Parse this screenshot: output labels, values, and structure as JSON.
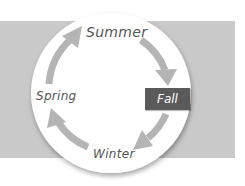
{
  "diagram": {
    "highlighted": "Fall",
    "stages": [
      {
        "id": "summer",
        "label": "Summer"
      },
      {
        "id": "fall",
        "label": "Fall"
      },
      {
        "id": "winter",
        "label": "Winter"
      },
      {
        "id": "spring",
        "label": "Spring"
      }
    ],
    "flow": [
      {
        "from": "Spring",
        "to": "Summer"
      },
      {
        "from": "Summer",
        "to": "Fall"
      },
      {
        "from": "Fall",
        "to": "Winter"
      },
      {
        "from": "Winter",
        "to": "Spring"
      }
    ],
    "direction": "clockwise"
  },
  "colors": {
    "band": "#c9c9c9",
    "circle": "#ffffff",
    "arrow": "#b4b4b4",
    "label_text": "#555555",
    "highlight_box": "#5a5a5a",
    "highlight_text": "#ffffff"
  }
}
